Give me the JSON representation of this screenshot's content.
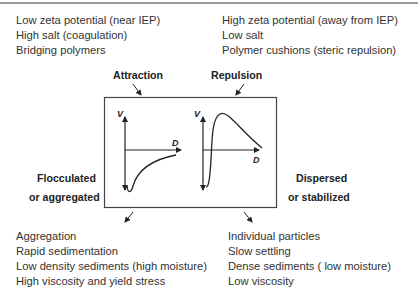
{
  "top_left_conditions": {
    "items": [
      "Low zeta potential (near IEP)",
      "High salt (coagulation)",
      "Bridging polymers"
    ]
  },
  "top_right_conditions": {
    "items": [
      "High zeta potential (away from IEP)",
      "Low salt",
      "Polymer cushions (steric repulsion)"
    ]
  },
  "labels": {
    "attraction": "Attraction",
    "repulsion": "Repulsion",
    "flocculated_line1": "Flocculated",
    "flocculated_line2": "or aggregated",
    "dispersed_line1": "Dispersed",
    "dispersed_line2": "or stabilized"
  },
  "plots": {
    "left": {
      "y_axis": "V",
      "x_axis": "D",
      "description": "attractive potential with deep primary minimum"
    },
    "right": {
      "y_axis": "V",
      "x_axis": "D",
      "description": "repulsive potential with energy barrier maximum"
    }
  },
  "bottom_left_outcomes": {
    "items": [
      "Aggregation",
      "Rapid sedimentation",
      "Low density sediments (high moisture)",
      "High viscosity and yield stress"
    ]
  },
  "bottom_right_outcomes": {
    "items": [
      "Individual particles",
      "Slow settling",
      "Dense sediments ( low moisture)",
      "Low viscosity"
    ]
  },
  "colors": {
    "text": "#333333",
    "line": "#222222",
    "rule": "#9a9a9a"
  }
}
